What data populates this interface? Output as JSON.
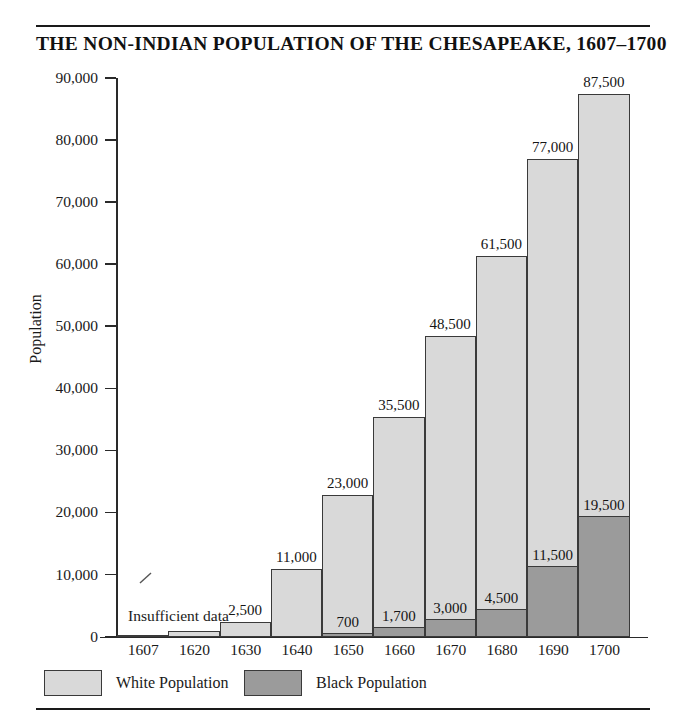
{
  "title": "THE NON-INDIAN POPULATION OF THE CHESAPEAKE, 1607–1700",
  "annotation": "Insufficient data",
  "legend": {
    "items": [
      {
        "label": "White Population",
        "color": "#d9d9d9",
        "name": "white-population"
      },
      {
        "label": "Black Population",
        "color": "#9b9b9b",
        "name": "black-population"
      }
    ]
  },
  "axis": {
    "y_title": "Population",
    "y_ticks": [
      "0",
      "10,000",
      "20,000",
      "30,000",
      "40,000",
      "50,000",
      "60,000",
      "70,000",
      "80,000",
      "90,000"
    ]
  },
  "chart_data": {
    "type": "bar",
    "title": "THE NON-INDIAN POPULATION OF THE CHESAPEAKE, 1607–1700",
    "xlabel": "",
    "ylabel": "Population",
    "ylim": [
      0,
      90000
    ],
    "ytick_step": 10000,
    "grid": false,
    "stacked": true,
    "legend_position": "bottom-left",
    "categories": [
      "1607",
      "1620",
      "1630",
      "1640",
      "1650",
      "1660",
      "1670",
      "1680",
      "1690",
      "1700"
    ],
    "series": [
      {
        "name": "Black Population",
        "color": "#9b9b9b",
        "values": [
          null,
          null,
          null,
          null,
          700,
          1700,
          3000,
          4500,
          11500,
          19500
        ],
        "labels": [
          "",
          "",
          "",
          "",
          "700",
          "1,700",
          "3,000",
          "4,500",
          "11,500",
          "19,500"
        ]
      },
      {
        "name": "White Population",
        "color": "#d9d9d9",
        "values": [
          350,
          1000,
          2500,
          11000,
          22300,
          33800,
          45500,
          57000,
          65500,
          68000
        ]
      }
    ],
    "totals": [
      350,
      1000,
      2500,
      11000,
      23000,
      35500,
      48500,
      61500,
      77000,
      87500
    ],
    "total_labels": [
      "",
      "",
      "2,500",
      "11,000",
      "23,000",
      "35,500",
      "48,500",
      "61,500",
      "77,000",
      "87,500"
    ],
    "annotations": [
      {
        "text": "Insufficient data",
        "applies_to": [
          "1607",
          "1620"
        ]
      }
    ]
  }
}
